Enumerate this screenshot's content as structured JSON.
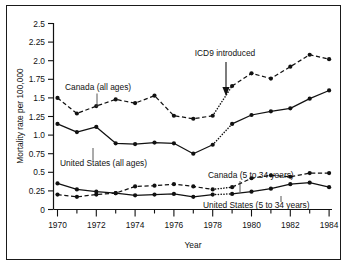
{
  "figure": {
    "name": "mortality-rate-line-chart",
    "border_color": "#1a1a1a",
    "background": "#ffffff",
    "ink_color": "#111111"
  },
  "chart_data": {
    "type": "line",
    "title": "",
    "xlabel": "Year",
    "ylabel": "Mortality rate per 100,000",
    "xlim": [
      1970,
      1984
    ],
    "ylim": [
      0,
      2.5
    ],
    "grid": false,
    "legend_position": "inline-annotations",
    "x": [
      1970,
      1971,
      1972,
      1973,
      1974,
      1975,
      1976,
      1977,
      1978,
      1979,
      1980,
      1981,
      1982,
      1983,
      1984
    ],
    "xticks_major": [
      "1970",
      "1972",
      "1974",
      "1976",
      "1978",
      "1980",
      "1982",
      "1984"
    ],
    "xticks_minor": [
      "1971",
      "1973",
      "1975",
      "1977",
      "1979",
      "1981",
      "1983"
    ],
    "yticks": [
      "2.5",
      "2.25",
      "2.0",
      "1.75",
      "1.5",
      "1.25",
      "1.0",
      "0.75",
      "0.5",
      "0.25",
      "0"
    ],
    "ytick_values": [
      2.5,
      2.25,
      2.0,
      1.75,
      1.5,
      1.25,
      1.0,
      0.75,
      0.5,
      0.25,
      0
    ],
    "series": [
      {
        "name": "Canada (all ages)",
        "style": "dashed",
        "label": "Canada (all ages)",
        "values": [
          1.5,
          1.29,
          1.39,
          1.48,
          1.43,
          1.53,
          1.26,
          1.22,
          1.26,
          1.66,
          1.83,
          1.76,
          1.92,
          2.08,
          2.02
        ]
      },
      {
        "name": "United States (all ages)",
        "style": "solid",
        "label": "United States (all ages)",
        "values": [
          1.15,
          1.04,
          1.11,
          0.89,
          0.88,
          0.9,
          0.89,
          0.75,
          0.87,
          1.15,
          1.27,
          1.32,
          1.36,
          1.49,
          1.6
        ]
      },
      {
        "name": "Canada (5 to 34 years)",
        "style": "dashed",
        "label": "Canada (5 to 34 years)",
        "values": [
          0.2,
          0.17,
          0.2,
          0.22,
          0.31,
          0.32,
          0.34,
          0.31,
          0.27,
          0.3,
          0.42,
          0.46,
          0.44,
          0.49,
          0.49
        ]
      },
      {
        "name": "United States (5 to 34 years)",
        "style": "solid",
        "label": "United States (5 to 34 years)",
        "values": [
          0.35,
          0.27,
          0.24,
          0.22,
          0.19,
          0.2,
          0.21,
          0.17,
          0.2,
          0.21,
          0.24,
          0.28,
          0.34,
          0.36,
          0.3
        ]
      }
    ],
    "break_segment": {
      "from_year": 1978,
      "to_year": 1979,
      "style": "dotted",
      "note": "discontinuity where ICD9 introduced"
    },
    "annotations": [
      {
        "text": "ICD9 introduced",
        "x": 1978.35,
        "y": 2.18,
        "arrow_to_y": 1.55,
        "arrow": "down"
      }
    ]
  },
  "labels": {
    "canada_all": "Canada (all ages)",
    "us_all": "United States (all ages)",
    "canada_534": "Canada (5 to 34 years)",
    "us_534": "United States (5 to 34 years)",
    "icd9": "ICD9 introduced",
    "xaxis": "Year",
    "yaxis": "Mortality rate per 100,000"
  }
}
